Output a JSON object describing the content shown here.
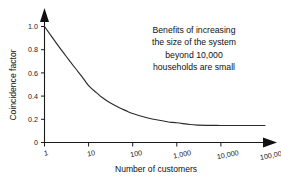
{
  "chart_data": {
    "type": "line",
    "title": "",
    "xlabel": "Number of customers",
    "ylabel": "Coincidence factor",
    "xscale": "log",
    "xlim": [
      1,
      100000
    ],
    "ylim": [
      0,
      1.0
    ],
    "grid": false,
    "legend": null,
    "xticks": [
      1,
      10,
      100,
      1000,
      10000,
      100000
    ],
    "xtick_labels": [
      "1",
      "10",
      "100",
      "1,000",
      "10,000",
      "100,000"
    ],
    "yticks": [
      0,
      0.2,
      0.4,
      0.6,
      0.8,
      1.0
    ],
    "ytick_labels": [
      "0",
      "0.2",
      "0.4",
      "0.6",
      "0.8",
      "1.0"
    ],
    "series": [
      {
        "name": "Coincidence factor",
        "x": [
          1,
          2,
          3,
          5,
          7,
          10,
          15,
          20,
          30,
          50,
          70,
          100,
          200,
          300,
          500,
          700,
          1000,
          2000,
          3000,
          5000,
          10000,
          20000,
          50000,
          100000
        ],
        "values": [
          1.0,
          0.84,
          0.75,
          0.64,
          0.57,
          0.49,
          0.43,
          0.39,
          0.345,
          0.3,
          0.275,
          0.25,
          0.215,
          0.2,
          0.185,
          0.175,
          0.17,
          0.155,
          0.15,
          0.148,
          0.147,
          0.147,
          0.147,
          0.147
        ]
      }
    ],
    "annotations": [
      {
        "text": "Benefits of increasing\nthe size of the system\nbeyond 10,000\nhouseholds are small"
      }
    ]
  },
  "style": {
    "axis_color": "#1a1a1a",
    "curve_color": "#2b2b2b",
    "background": "#ffffff"
  }
}
